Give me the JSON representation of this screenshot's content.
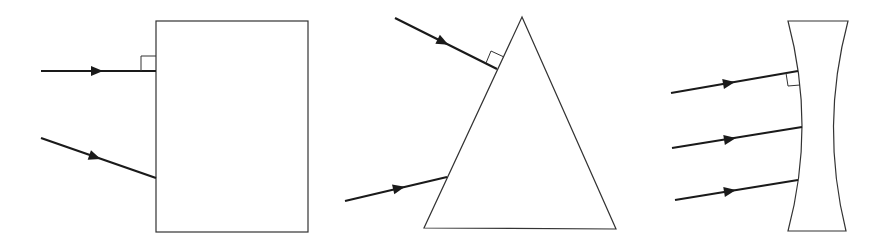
{
  "diagram": {
    "colors": {
      "background": "#ffffff",
      "outline": "#333333",
      "ray": "#1a1a1a"
    },
    "objects": [
      {
        "name": "rectangular-block",
        "shape": "rectangle",
        "x": 156,
        "y": 21,
        "width": 152,
        "height": 211,
        "rays": [
          {
            "from": [
              41,
              71
            ],
            "to": [
              156,
              71
            ],
            "arrow_at": [
              97,
              71
            ],
            "normal_incidence": true
          },
          {
            "from": [
              41,
              138
            ],
            "to": [
              156,
              178
            ],
            "arrow_at": [
              95,
              157
            ],
            "normal_incidence": false
          }
        ],
        "right_angle_marker": {
          "points": "141,71 141,56 156,56"
        }
      },
      {
        "name": "triangular-prism",
        "shape": "triangle",
        "points": "522,17 424,228 616,229",
        "rays": [
          {
            "from": [
              395,
              18
            ],
            "to": [
              497,
              69
            ],
            "arrow_at": [
              443,
              42
            ],
            "normal_incidence": true
          },
          {
            "from": [
              345,
              201
            ],
            "to": [
              447,
              177
            ],
            "arrow_at": [
              399,
              188
            ],
            "normal_incidence": false
          }
        ],
        "right_angle_marker": {
          "points": "486,63 491,51 504,57"
        }
      },
      {
        "name": "concave-lens",
        "shape": "biconcave-lens",
        "path": "M788,21 L848,21 Q820,126 846,231 L788,231 Q816,126 788,21 Z",
        "rays": [
          {
            "from": [
              671,
              93
            ],
            "to": [
              798,
              71
            ],
            "arrow_at": [
              729,
              83
            ],
            "normal_incidence": true
          },
          {
            "from": [
              672,
              148
            ],
            "to": [
              802,
              127
            ],
            "arrow_at": [
              730,
              139
            ],
            "normal_incidence": false
          },
          {
            "from": [
              675,
              200
            ],
            "to": [
              798,
              180
            ],
            "arrow_at": [
              730,
              191
            ],
            "normal_incidence": false
          }
        ],
        "right_angle_marker": {
          "points": "786,73 788,86 800,85"
        }
      }
    ]
  }
}
